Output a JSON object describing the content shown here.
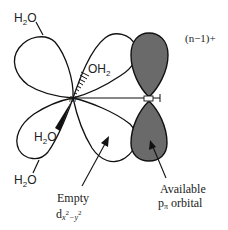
{
  "diagram": {
    "type": "orbital-overlap",
    "charge_label": "(n−1)+",
    "metal_label": "M",
    "atoms": {
      "e": "E",
      "h": "H"
    },
    "ligands": {
      "top_left": {
        "main": "H",
        "sub": "2",
        "tail": "O"
      },
      "upper_back": {
        "main": "OH",
        "sub": "2"
      },
      "front": {
        "main": "H",
        "sub": "2",
        "tail": "O"
      },
      "bottom_left": {
        "main": "H",
        "sub": "2",
        "tail": "O"
      }
    },
    "empty_orbital": {
      "line1": "Empty",
      "d": "d",
      "sub_x": "x",
      "sup_2a": "2",
      "minus_y": "−y",
      "sup_2b": "2"
    },
    "p_orbital": {
      "line1": "Available",
      "p": "p",
      "sub_pi": "π",
      "rest": " orbital"
    },
    "colors": {
      "outline": "#111111",
      "p_lobe_fill": "#6a6a6a",
      "d_lobe_fill": "#ffffff"
    }
  }
}
